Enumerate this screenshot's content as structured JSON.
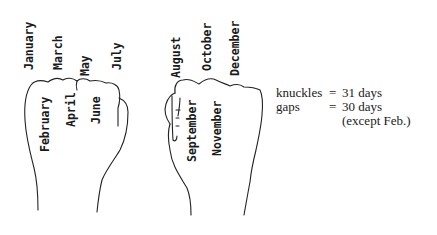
{
  "diagram": {
    "left_fist": {
      "knuckles": [
        "January",
        "March",
        "May",
        "July"
      ],
      "gaps": [
        "February",
        "April",
        "June"
      ]
    },
    "right_fist": {
      "knuckles": [
        "August",
        "October",
        "December"
      ],
      "gaps": [
        "September",
        "November"
      ]
    }
  },
  "legend": {
    "rows": [
      {
        "label": "knuckles",
        "equals": "=",
        "value": "31 days"
      },
      {
        "label": "gaps",
        "equals": "=",
        "value": "30 days"
      },
      {
        "label": "",
        "equals": "",
        "value": "(except Feb.)"
      }
    ]
  },
  "colors": {
    "ink": "#1a1a1a",
    "background": "#ffffff"
  }
}
